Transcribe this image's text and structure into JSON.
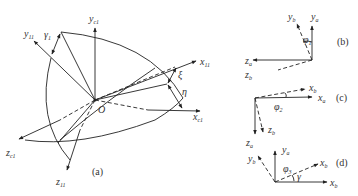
{
  "figure": {
    "panel_a": {
      "caption": "(a)",
      "origin": "O",
      "axes": [
        {
          "id": "y_c1",
          "base": "y",
          "sub": "c1"
        },
        {
          "id": "y_11",
          "base": "y",
          "sub": "11"
        },
        {
          "id": "x_11",
          "base": "x",
          "sub": "11"
        },
        {
          "id": "x_c1",
          "base": "x",
          "sub": "c1"
        },
        {
          "id": "z_c1",
          "base": "z",
          "sub": "c1"
        },
        {
          "id": "z_11",
          "base": "z",
          "sub": "11"
        }
      ],
      "angles": [
        {
          "id": "gamma1",
          "base": "γ",
          "sub": "1"
        },
        {
          "id": "xi",
          "base": "ξ",
          "sub": ""
        },
        {
          "id": "eta",
          "base": "η",
          "sub": ""
        }
      ]
    },
    "panel_b": {
      "caption": "(b)",
      "axes": [
        {
          "id": "y_b",
          "base": "y",
          "sub": "b"
        },
        {
          "id": "y_a",
          "base": "y",
          "sub": "a"
        },
        {
          "id": "z_a",
          "base": "z",
          "sub": "a"
        },
        {
          "id": "z_b",
          "base": "z",
          "sub": "b"
        }
      ],
      "angle": {
        "base": "φ",
        "sub": "1"
      }
    },
    "panel_c": {
      "caption": "(c)",
      "axes": [
        {
          "id": "x_b",
          "base": "x",
          "sub": "b"
        },
        {
          "id": "x_a",
          "base": "x",
          "sub": "a"
        },
        {
          "id": "z_a",
          "base": "z",
          "sub": "a"
        },
        {
          "id": "z_b",
          "base": "z",
          "sub": "b"
        }
      ],
      "angle": {
        "base": "φ",
        "sub": "2"
      }
    },
    "panel_d": {
      "caption": "(d)",
      "axes": [
        {
          "id": "y_a",
          "base": "y",
          "sub": "a"
        },
        {
          "id": "y_b",
          "base": "y",
          "sub": "b"
        },
        {
          "id": "x_b_dashed",
          "base": "x",
          "sub": "b"
        },
        {
          "id": "x_b",
          "base": "x",
          "sub": "b"
        }
      ],
      "angle": {
        "base": "φ",
        "sub": "3"
      },
      "angle2": {
        "base": "γ",
        "sub": ""
      }
    }
  }
}
